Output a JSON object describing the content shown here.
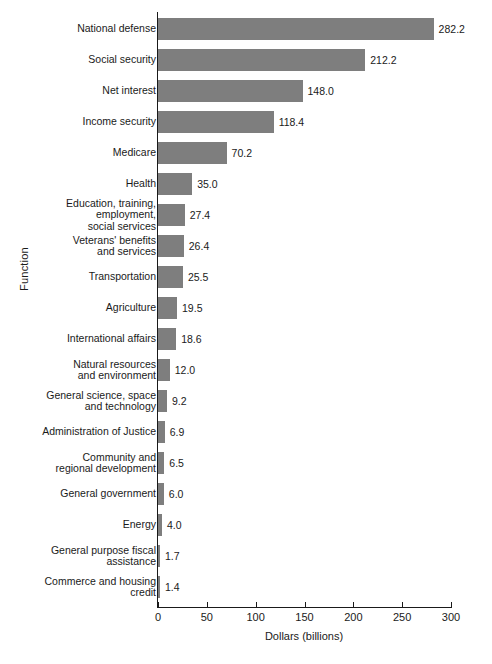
{
  "chart_data": {
    "type": "bar",
    "orientation": "horizontal",
    "title": "",
    "xlabel": "Dollars (billions)",
    "ylabel": "Function",
    "xlim": [
      0,
      300
    ],
    "xticks": [
      0,
      50,
      100,
      150,
      200,
      250,
      300
    ],
    "grid": false,
    "legend": null,
    "bar_color": "#7e7e7e",
    "categories": [
      "National defense",
      "Social security",
      "Net interest",
      "Income security",
      "Medicare",
      "Health",
      "Education, training,\nemployment,\nsocial services",
      "Veterans' benefits\nand services",
      "Transportation",
      "Agriculture",
      "International affairs",
      "Natural resources\nand environment",
      "General science, space\nand technology",
      "Administration of Justice",
      "Community and\nregional development",
      "General government",
      "Energy",
      "General purpose fiscal\nassistance",
      "Commerce and housing\ncredit"
    ],
    "values": [
      282.2,
      212.2,
      148.0,
      118.4,
      70.2,
      35.0,
      27.4,
      26.4,
      25.5,
      19.5,
      18.6,
      12.0,
      9.2,
      6.9,
      6.5,
      6.0,
      4.0,
      1.7,
      1.4
    ],
    "value_labels": [
      "282.2",
      "212.2",
      "148.0",
      "118.4",
      "70.2",
      "35.0",
      "27.4",
      "26.4",
      "25.5",
      "19.5",
      "18.6",
      "12.0",
      "9.2",
      "6.9",
      "6.5",
      "6.0",
      "4.0",
      "1.7",
      "1.4"
    ],
    "tick_labels": [
      "0",
      "50",
      "100",
      "150",
      "200",
      "250",
      "300"
    ]
  }
}
